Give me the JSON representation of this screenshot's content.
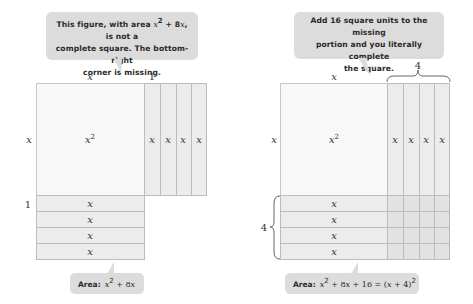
{
  "left_panel": {
    "callout": {
      "line1_pre": "This figure, with area ",
      "line1_math": "x",
      "line1_exp": "2",
      "line1_mid": " + 8",
      "line1_math2": "x",
      "line1_post": ", is not a",
      "line2": "complete square. The bottom-right",
      "line3": "corner is missing."
    },
    "top_label_x": "x",
    "top_label_1": "1",
    "side_label_x": "x",
    "side_label_1": "1",
    "square_label": "x",
    "square_exp": "2",
    "vertical_strip_labels": [
      "x",
      "x",
      "x",
      "x"
    ],
    "horizontal_strip_labels": [
      "x",
      "x",
      "x",
      "x"
    ],
    "area": {
      "prefix": "Area:",
      "expr_x": "x",
      "expr_exp": "2",
      "expr_rest_pre": " + 8",
      "expr_x2": "x"
    }
  },
  "right_panel": {
    "callout": {
      "line1": "Add 16 square units to the missing",
      "line2": "portion and you literally complete",
      "line3": "the square."
    },
    "top_label_x": "x",
    "top_brace_label": "4",
    "side_label_x": "x",
    "side_brace_label": "4",
    "square_label": "x",
    "square_exp": "2",
    "vertical_strip_labels": [
      "x",
      "x",
      "x",
      "x"
    ],
    "horizontal_strip_labels": [
      "x",
      "x",
      "x",
      "x"
    ],
    "area": {
      "prefix": "Area:",
      "expr_x": "x",
      "expr_exp": "2",
      "expr_mid": " + 8",
      "expr_x2": "x",
      "expr_mid2": " + 16 = (",
      "expr_x3": "x",
      "expr_end": " + 4)",
      "expr_exp2": "2"
    }
  },
  "colors": {
    "callout_bg": "#dcdcdc",
    "square_fill": "#f8f8f8",
    "strip_fill": "#ececec",
    "corner_fill": "#e2e2e2",
    "border": "#bcbcbc"
  }
}
